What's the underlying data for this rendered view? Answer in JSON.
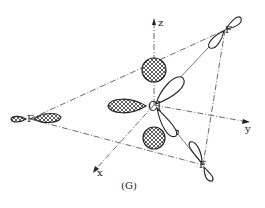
{
  "figure": {
    "caption": "(G)",
    "central_atom": "Cl",
    "ligands": [
      "F",
      "F",
      "F"
    ],
    "axes": {
      "x": "x",
      "y": "y",
      "z": "z"
    }
  }
}
